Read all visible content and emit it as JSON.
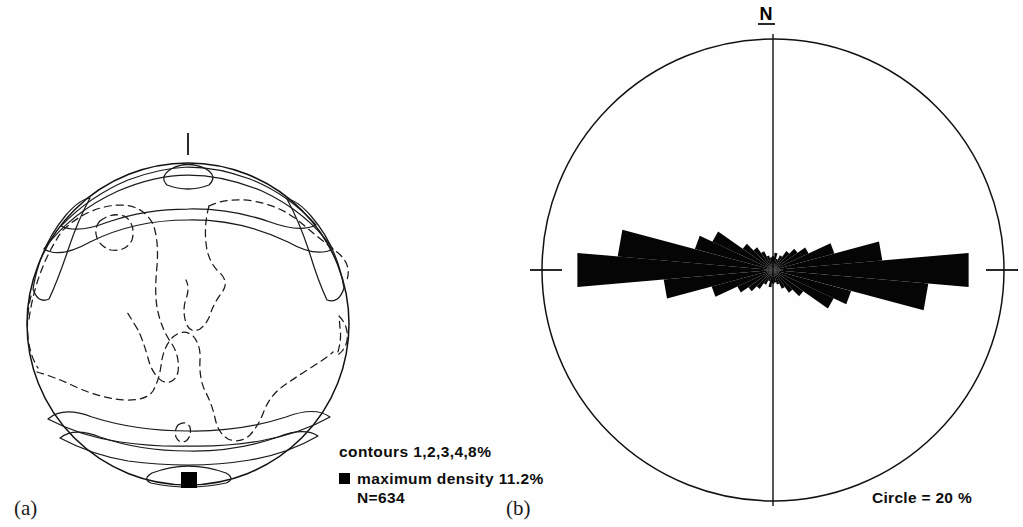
{
  "figure": {
    "header_fragment": "",
    "panels": [
      {
        "id": "a",
        "label": "(a)",
        "type": "stereonet-contour",
        "annotations": [
          "contours 1,2,3,4,8%",
          "maximum density 11.2%",
          "N=634"
        ],
        "contour_label": "contours 1,2,3,4,8%",
        "max_density_label": "maximum density 11.2%",
        "n_label": "N=634",
        "legend_marker_name": "filled-square-marker"
      },
      {
        "id": "b",
        "label": "(b)",
        "type": "rose-diagram",
        "north_label": "N",
        "scale_label": "Circle =  20 %"
      }
    ]
  },
  "chart_data": [
    {
      "type": "contour",
      "panel": "a",
      "title": "",
      "projection": "equal-area lower hemisphere stereonet",
      "contour_levels": [
        1,
        2,
        3,
        4,
        8
      ],
      "contour_unit": "%",
      "maximum_density": 11.2,
      "maximum_density_unit": "%",
      "n_observations": 634,
      "maximum_density_azimuth_deg": 180,
      "maximum_density_marker": "filled square at south margin",
      "line_styles": {
        "solid": "high-density contours (3,4,8%)",
        "dashed": "low-density contours (1,2%)"
      },
      "center": [
        188,
        324
      ],
      "radius": 161,
      "north_tick": true,
      "description": "Girdle of poles concentrated at north and south margins, indicating a sub-horizontal E-W fabric; maximum at south."
    },
    {
      "type": "rose",
      "panel": "b",
      "title": "",
      "north_label": "N",
      "scale_ring_percent": 20,
      "scale_text": "Circle =  20 %",
      "sector_width_deg": 10,
      "symmetry": "bidirectional",
      "center": [
        773,
        270
      ],
      "radius": 231,
      "axis_ticks": [
        "N",
        "E",
        "S",
        "W"
      ],
      "categories_deg": [
        0,
        10,
        20,
        30,
        40,
        50,
        60,
        70,
        80,
        90,
        100,
        110,
        120,
        130,
        140,
        150,
        160,
        170
      ],
      "values_percent": [
        1.2,
        1.5,
        1.0,
        1.4,
        2.0,
        2.6,
        3.4,
        5.5,
        9.5,
        17.0,
        13.5,
        7.0,
        5.8,
        3.2,
        2.4,
        1.8,
        1.3,
        1.1
      ],
      "peak_azimuth_deg": 90,
      "peak_value_percent": 17.0,
      "ylabel": "frequency (%)",
      "xlabel": "azimuth (degrees)",
      "description": "Strong E-W (090) preferred orientation with subordinate spread between 060 and 120."
    }
  ]
}
